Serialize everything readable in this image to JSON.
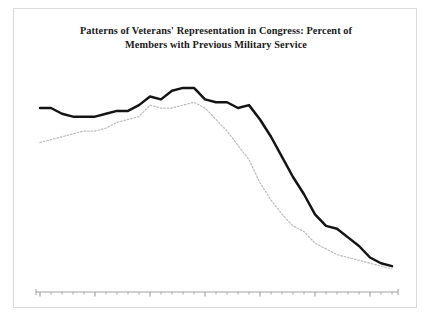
{
  "chart_data": {
    "type": "line",
    "title": "Patterns of Veterans' Representation in Congress: Percent of Members with Previous Military Service",
    "title_line1": "Patterns of Veterans' Representation in Congress: Percent of",
    "title_line2": "Members with Previous Military Service",
    "xlabel": "",
    "ylabel": "",
    "xlim": [
      1953,
      2017
    ],
    "ylim": [
      10,
      90
    ],
    "grid": false,
    "legend_position": "inline-annotation",
    "yticks": [
      90,
      80,
      70,
      60,
      50,
      40,
      30,
      20,
      10
    ],
    "xticks_major": [
      1953,
      1963,
      1973,
      1983,
      1993,
      2003,
      2013
    ],
    "xtick_minor_step": 2,
    "series": [
      {
        "name": "Senate",
        "style": "solid",
        "color": "#141414",
        "x": [
          1953,
          1955,
          1957,
          1959,
          1961,
          1963,
          1965,
          1967,
          1969,
          1971,
          1973,
          1975,
          1977,
          1979,
          1981,
          1983,
          1985,
          1987,
          1989,
          1991,
          1993,
          1995,
          1997,
          1999,
          2001,
          2003,
          2005,
          2007,
          2009,
          2011,
          2013,
          2015,
          2017
        ],
        "values": [
          74,
          74,
          72,
          71,
          71,
          71,
          72,
          73,
          73,
          75,
          78,
          77,
          80,
          81,
          81,
          77,
          76,
          76,
          74,
          75,
          70,
          64,
          57,
          50,
          44,
          37,
          33,
          32,
          29,
          26,
          22,
          20,
          19
        ]
      },
      {
        "name": "House",
        "style": "dotted",
        "color": "#bdbdbd",
        "x": [
          1953,
          1955,
          1957,
          1959,
          1961,
          1963,
          1965,
          1967,
          1969,
          1971,
          1973,
          1975,
          1977,
          1979,
          1981,
          1983,
          1985,
          1987,
          1989,
          1991,
          1993,
          1995,
          1997,
          1999,
          2001,
          2003,
          2005,
          2007,
          2009,
          2011,
          2013,
          2015,
          2017
        ],
        "values": [
          62,
          63,
          64,
          65,
          66,
          66,
          67,
          69,
          70,
          71,
          75,
          74,
          74,
          75,
          76,
          74,
          70,
          66,
          61,
          56,
          48,
          42,
          37,
          33,
          31,
          27,
          25,
          23,
          22,
          21,
          20,
          19,
          18
        ]
      }
    ],
    "annotations": [
      {
        "text": "74%",
        "series": "Senate",
        "x": 1953,
        "value": 74
      },
      {
        "text": "81%",
        "series": "Senate",
        "x": 1979,
        "value": 81
      },
      {
        "text": "70%",
        "series": "Senate",
        "x": 1993,
        "value": 70
      },
      {
        "text": "37%",
        "series": "Senate",
        "x": 2003,
        "value": 37
      },
      {
        "text": "19%",
        "series": "Senate",
        "x": 2017,
        "value": 19
      },
      {
        "text": "62%",
        "series": "House",
        "x": 1953,
        "value": 62
      },
      {
        "text": "75%",
        "series": "House",
        "x": 1973,
        "value": 75
      },
      {
        "text": "48%",
        "series": "House",
        "x": 1993,
        "value": 48
      },
      {
        "text": "27%",
        "series": "House",
        "x": 2003,
        "value": 27
      },
      {
        "text": "18%",
        "series": "House",
        "x": 2017,
        "value": 18
      }
    ],
    "series_labels": [
      {
        "text": "Senate",
        "series": "Senate"
      },
      {
        "text": "House",
        "series": "House"
      }
    ]
  },
  "axis": {
    "ytick_labels": [
      "90",
      "80",
      "70",
      "60",
      "50",
      "40",
      "30",
      "20",
      "10"
    ],
    "xtick_labels": [
      "1953",
      "1963",
      "1973",
      "1983",
      "1993",
      "2003",
      "2013"
    ]
  },
  "annotations_text": {
    "senate_1953": "74%",
    "senate_1979": "81%",
    "senate_1993": "70%",
    "senate_2003": "37%",
    "senate_2017": "19%",
    "house_1953": "62%",
    "house_1973": "75%",
    "house_1993": "48%",
    "house_2003": "27%",
    "house_2017": "18%",
    "label_senate": "Senate",
    "label_house": "House"
  },
  "colors": {
    "senate_line": "#141414",
    "house_line": "#bdbdbd",
    "axis": "#8a8a8a",
    "frame": "#d9d9d9",
    "title": "#1a1a1a"
  }
}
